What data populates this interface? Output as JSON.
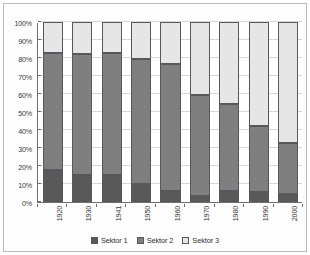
{
  "chart_data": {
    "type": "bar",
    "subtype": "100% stacked bar",
    "title": "",
    "xlabel": "",
    "ylabel": "",
    "categories": [
      "1920",
      "1930",
      "1941",
      "1950",
      "1960",
      "1970",
      "1980",
      "1990",
      "2000"
    ],
    "series": [
      {
        "name": "Sektor 1",
        "color": "#595959",
        "values": [
          18,
          15,
          15,
          10,
          6,
          3.5,
          6,
          5.5,
          4.5
        ]
      },
      {
        "name": "Sektor 2",
        "color": "#7f7f7f",
        "values": [
          65,
          67,
          68,
          69.5,
          70.5,
          56,
          48.5,
          36.5,
          28.5
        ]
      },
      {
        "name": "Sektor 3",
        "color": "#e6e6e6",
        "values": [
          17,
          18,
          17,
          20.5,
          23.5,
          40.5,
          45.5,
          58,
          67
        ]
      }
    ],
    "cumulative_tops": [
      {
        "category": "1920",
        "s1_top": 18,
        "s2_top": 83,
        "s3_top": 100
      },
      {
        "category": "1930",
        "s1_top": 15,
        "s2_top": 82,
        "s3_top": 100
      },
      {
        "category": "1941",
        "s1_top": 15,
        "s2_top": 83,
        "s3_top": 100
      },
      {
        "category": "1950",
        "s1_top": 10,
        "s2_top": 79.5,
        "s3_top": 100
      },
      {
        "category": "1960",
        "s1_top": 6,
        "s2_top": 76.5,
        "s3_top": 100
      },
      {
        "category": "1970",
        "s1_top": 3.5,
        "s2_top": 59.5,
        "s3_top": 100
      },
      {
        "category": "1980",
        "s1_top": 6,
        "s2_top": 54.5,
        "s3_top": 100
      },
      {
        "category": "1990",
        "s1_top": 5.5,
        "s2_top": 42,
        "s3_top": 100
      },
      {
        "category": "2000",
        "s1_top": 4.5,
        "s2_top": 33,
        "s3_top": 100
      }
    ],
    "ylim": [
      0,
      100
    ],
    "yticks": [
      "0%",
      "10%",
      "20%",
      "30%",
      "40%",
      "50%",
      "60%",
      "70%",
      "80%",
      "90%",
      "100%"
    ],
    "ytick_values": [
      0,
      10,
      20,
      30,
      40,
      50,
      60,
      70,
      80,
      90,
      100
    ],
    "grid": true,
    "grid_axis": "y",
    "legend": {
      "position": "bottom",
      "entries": [
        {
          "label": "Sektor 1",
          "color": "#595959"
        },
        {
          "label": "Sektor 2",
          "color": "#7f7f7f"
        },
        {
          "label": "Sektor 3",
          "color": "#e6e6e6"
        }
      ]
    },
    "colors": {
      "sektor1": "#595959",
      "sektor2": "#7f7f7f",
      "sektor3": "#e6e6e6",
      "axis": "#6f6f6f",
      "grid": "#d8d8d8",
      "plot_background": "#ffffff",
      "figure_background": "#fdfdfd",
      "figure_border": "#b9b9b9",
      "bar_outline": "#58585a"
    }
  }
}
